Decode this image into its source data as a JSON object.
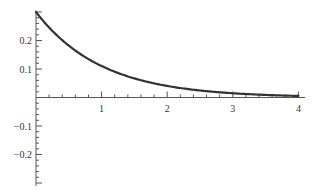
{
  "chart_data": {
    "type": "line",
    "title": "",
    "xlabel": "",
    "ylabel": "",
    "function": "0.3*exp(-x)",
    "xlim": [
      0,
      4.1
    ],
    "ylim": [
      -0.31,
      0.305
    ],
    "grid": false,
    "legend": null,
    "x_ticks": [
      1,
      2,
      3,
      4
    ],
    "x_tick_labels": [
      "1",
      "2",
      "3",
      "4"
    ],
    "y_ticks": [
      0.2,
      0.1,
      -0.1,
      -0.2
    ],
    "y_tick_labels": [
      "0.2",
      "0.1",
      "−0.1",
      "−0.2"
    ],
    "series": [
      {
        "name": "f(x)",
        "color": "#333333",
        "x": [
          0,
          0.25,
          0.5,
          0.75,
          1.0,
          1.25,
          1.5,
          1.75,
          2.0,
          2.5,
          3.0,
          3.5,
          4.0
        ],
        "values": [
          0.3,
          0.234,
          0.182,
          0.142,
          0.11,
          0.086,
          0.067,
          0.052,
          0.041,
          0.025,
          0.015,
          0.009,
          0.0055
        ]
      }
    ]
  },
  "style": {
    "axis_color": "#555555",
    "curve_color": "#333333",
    "background": "#ffffff"
  }
}
